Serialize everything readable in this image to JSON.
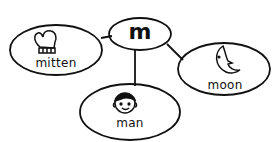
{
  "diagram": {
    "type": "word-web",
    "center": {
      "label": "m"
    },
    "nodes": [
      {
        "label": "mitten",
        "icon": "mitten-icon"
      },
      {
        "label": "moon",
        "icon": "crescent-moon-icon"
      },
      {
        "label": "man",
        "icon": "man-face-icon"
      }
    ],
    "colors": {
      "stroke": "#111111",
      "background": "#ffffff"
    }
  }
}
